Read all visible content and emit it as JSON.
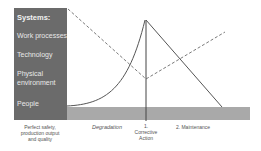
{
  "panel": {
    "title": "Systems:",
    "items": [
      "Work processes",
      "Technology",
      "Physical",
      "environment",
      "People"
    ]
  },
  "labels": {
    "start": [
      "Perfect safety,",
      "production output",
      "and quality"
    ],
    "degradation": "Degradation",
    "corrective": [
      "1.",
      "Corrective",
      "Action"
    ],
    "maintenance": "2. Maintenance"
  },
  "colors": {
    "panel": "#6b6b6b",
    "bar": "#a9a9a9",
    "line": "#555555",
    "dashed": "#7a7a7a"
  }
}
